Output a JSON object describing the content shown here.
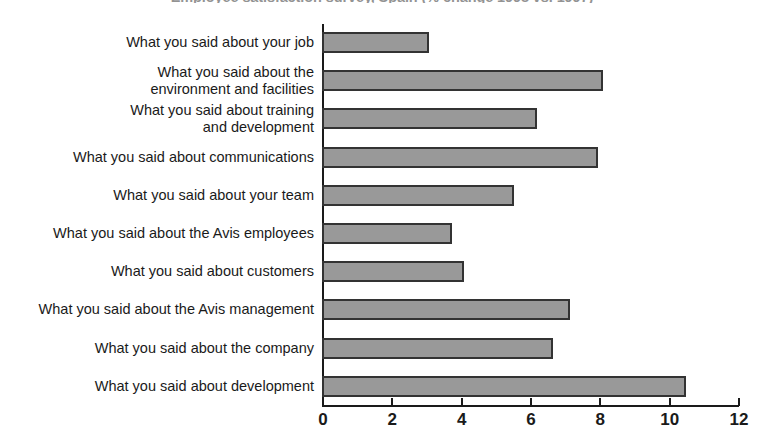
{
  "chart_data": {
    "type": "bar",
    "orientation": "horizontal",
    "title": "Employee satisfaction survey, Spain (% change 1998 vs. 1997)",
    "title_note": "clipped at top edge of screenshot",
    "xlabel": "",
    "ylabel": "",
    "xlim": [
      0,
      12
    ],
    "xticks": [
      0,
      2,
      4,
      6,
      8,
      10,
      12
    ],
    "xtick_labels": [
      "0",
      "2",
      "4",
      "6",
      "8",
      "10",
      "12"
    ],
    "grid": false,
    "legend": false,
    "bar_color": "#999999",
    "bar_border_color": "#333333",
    "background": "#ffffff",
    "categories": [
      "What you said about your job",
      "What you said about the\nenvironment and facilities",
      "What you said about training\nand development",
      "What you said about communications",
      "What you said about your team",
      "What you said about the Avis employees",
      "What you said about customers",
      "What you said about the Avis management",
      "What you said about the company",
      "What you said about development"
    ],
    "values": [
      3.1,
      8.1,
      6.2,
      7.95,
      5.55,
      3.75,
      4.1,
      7.15,
      6.65,
      10.5
    ]
  }
}
